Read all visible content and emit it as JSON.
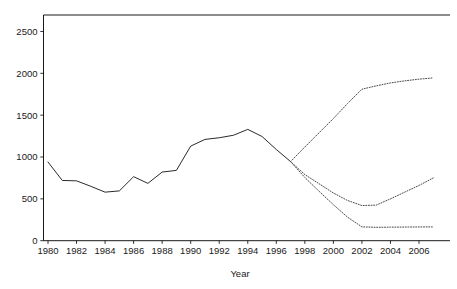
{
  "chart_data": {
    "type": "line",
    "title": "",
    "subtitle": "",
    "xlabel": "Year",
    "ylabel": "",
    "xlim": [
      1979.5,
      2007.5
    ],
    "ylim": [
      0,
      2500
    ],
    "grid": false,
    "legend": "none",
    "x_ticks": [
      1980,
      1982,
      1984,
      1986,
      1988,
      1990,
      1992,
      1994,
      1996,
      1998,
      2000,
      2002,
      2004,
      2006
    ],
    "y_ticks": [
      0,
      500,
      1000,
      1500,
      2000,
      2500
    ],
    "x_tick_labels": [
      "1980",
      "1982",
      "1984",
      "1986",
      "1988",
      "1990",
      "1992",
      "1994",
      "1996",
      "1998",
      "2000",
      "2002",
      "2004",
      "2006"
    ],
    "y_tick_labels": [
      "0",
      "500",
      "1000",
      "1500",
      "2000",
      "2500"
    ],
    "series": [
      {
        "name": "historical",
        "style": "solid",
        "color": "#2b2b2b",
        "x": [
          1980,
          1981,
          1982,
          1983,
          1984,
          1985,
          1986,
          1987,
          1988,
          1989,
          1990,
          1991,
          1992,
          1993,
          1994,
          1995,
          1996,
          1997
        ],
        "values": [
          940,
          720,
          715,
          650,
          580,
          595,
          765,
          685,
          820,
          840,
          1130,
          1210,
          1230,
          1260,
          1330,
          1245,
          1090,
          945
        ]
      },
      {
        "name": "forecast-high",
        "style": "dotted",
        "color": "#4a4a4a",
        "x": [
          1997,
          1998,
          1999,
          2000,
          2001,
          2002,
          2003,
          2004,
          2005,
          2006,
          2007
        ],
        "values": [
          945,
          1120,
          1290,
          1460,
          1640,
          1810,
          1850,
          1885,
          1910,
          1930,
          1945
        ]
      },
      {
        "name": "forecast-middle",
        "style": "dotted",
        "color": "#4a4a4a",
        "x": [
          1997,
          1998,
          1999,
          2000,
          2001,
          2002,
          2003,
          2004,
          2005,
          2006,
          2007
        ],
        "values": [
          945,
          790,
          680,
          570,
          480,
          420,
          425,
          500,
          580,
          660,
          750
        ]
      },
      {
        "name": "forecast-low",
        "style": "dotted",
        "color": "#4a4a4a",
        "x": [
          1997,
          1998,
          1999,
          2000,
          2001,
          2002,
          2003,
          2004,
          2005,
          2006,
          2007
        ],
        "values": [
          945,
          755,
          590,
          430,
          280,
          165,
          160,
          162,
          163,
          164,
          165
        ]
      }
    ]
  },
  "axes": {
    "x_axis_title": "Year"
  }
}
